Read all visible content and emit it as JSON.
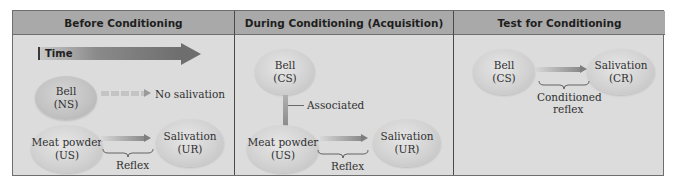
{
  "diagram": {
    "type": "classical-conditioning-flow",
    "colors": {
      "frame_border": "#6e6e6e",
      "header_bg": "#a9a9a9",
      "panel_bg": "#dcdcdc",
      "ellipse": "#d2d2d2",
      "arrow": "#7e7e7e"
    },
    "panels": [
      {
        "title": "Before Conditioning",
        "time_arrow_label": "Time",
        "nodes": {
          "bell": {
            "name": "Bell",
            "tag": "(NS)"
          },
          "no_response": "No salivation",
          "meat": {
            "name": "Meat powder",
            "tag": "(US)"
          },
          "salivation": {
            "name": "Salivation",
            "tag": "(UR)"
          }
        },
        "brace_label": "Reflex"
      },
      {
        "title": "During Conditioning (Acquisition)",
        "nodes": {
          "bell": {
            "name": "Bell",
            "tag": "(CS)"
          },
          "link_label": "Associated",
          "meat": {
            "name": "Meat powder",
            "tag": "(US)"
          },
          "salivation": {
            "name": "Salivation",
            "tag": "(UR)"
          }
        },
        "brace_label": "Reflex"
      },
      {
        "title": "Test for Conditioning",
        "nodes": {
          "bell": {
            "name": "Bell",
            "tag": "(CS)"
          },
          "salivation": {
            "name": "Salivation",
            "tag": "(CR)"
          }
        },
        "brace_label_line1": "Conditioned",
        "brace_label_line2": "reflex"
      }
    ]
  }
}
